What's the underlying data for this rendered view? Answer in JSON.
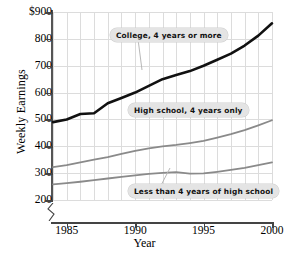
{
  "chart_data": {
    "type": "line",
    "title": "",
    "xlabel": "Year",
    "ylabel": "Weekly Earnings",
    "xlim": [
      1984,
      2000
    ],
    "ylim": [
      200,
      900
    ],
    "yticks": [
      "$900",
      "800",
      "700",
      "600",
      "500",
      "400",
      "300",
      "200"
    ],
    "ytick_values": [
      900,
      800,
      700,
      600,
      500,
      400,
      300,
      200
    ],
    "xticks": [
      "1985",
      "1990",
      "1995",
      "2000"
    ],
    "xtick_values": [
      1985,
      1990,
      1995,
      2000
    ],
    "grid": true,
    "grid_x_step": 1,
    "grid_y_step": 100,
    "y_axis_break": true,
    "legend_position": "inline-callouts",
    "x": [
      1984,
      1985,
      1986,
      1987,
      1988,
      1989,
      1990,
      1991,
      1992,
      1993,
      1994,
      1995,
      1996,
      1997,
      1998,
      1999,
      2000
    ],
    "series": [
      {
        "name": "College, 4 years or more",
        "color": "#111111",
        "width": 2.6,
        "values": [
          490,
          500,
          520,
          523,
          560,
          580,
          600,
          625,
          650,
          665,
          680,
          700,
          722,
          745,
          775,
          812,
          858
        ]
      },
      {
        "name": "High school, 4 years only",
        "color": "#8a8a8a",
        "width": 1.8,
        "values": [
          322,
          330,
          340,
          350,
          360,
          372,
          383,
          392,
          400,
          405,
          412,
          420,
          432,
          445,
          460,
          478,
          497
        ]
      },
      {
        "name": "Less than 4 years of high school",
        "color": "#8a8a8a",
        "width": 1.8,
        "values": [
          258,
          263,
          268,
          274,
          280,
          286,
          292,
          297,
          301,
          304,
          298,
          299,
          305,
          312,
          320,
          330,
          340
        ]
      }
    ],
    "annotations": [
      {
        "text": "College, 4 years or more",
        "x_px": 110,
        "y_px": 28,
        "leader": true,
        "leader_to_x": 142,
        "leader_to_y": 70
      },
      {
        "text": "High school, 4 years only",
        "x_px": 128,
        "y_px": 103,
        "leader": false
      },
      {
        "text": "Less than 4 years of high school",
        "x_px": 128,
        "y_px": 184,
        "leader": true,
        "leader_to_x": 170,
        "leader_to_y": 168
      }
    ]
  }
}
